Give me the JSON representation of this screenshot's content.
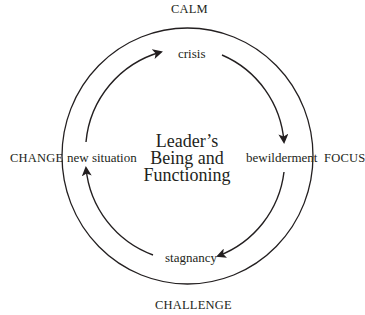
{
  "diagram": {
    "center_title": {
      "lines": [
        "Leader’s",
        "Being and",
        "Functioning"
      ]
    },
    "outer_labels": {
      "top": "CALM",
      "right": "FOCUS",
      "bottom": "CHALLENGE",
      "left": "CHANGE"
    },
    "cycle_stages": [
      {
        "position": "top",
        "label": "crisis"
      },
      {
        "position": "right",
        "label": "bewilderment"
      },
      {
        "position": "bottom",
        "label": "stagnancy"
      },
      {
        "position": "left",
        "label": "new situation"
      }
    ],
    "cycle_direction": "clockwise",
    "arrows": [
      {
        "from": "crisis",
        "to": "bewilderment"
      },
      {
        "from": "bewilderment",
        "to": "stagnancy"
      },
      {
        "from": "stagnancy",
        "to": "new situation"
      },
      {
        "from": "new situation",
        "to": "crisis"
      }
    ],
    "colors": {
      "line": "#231f20",
      "background": "#ffffff"
    }
  }
}
